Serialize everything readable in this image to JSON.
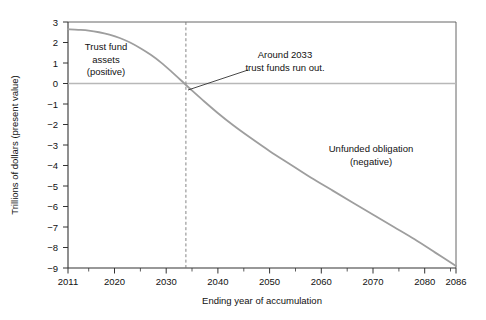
{
  "chart_data": {
    "type": "line",
    "title": "",
    "xlabel": "Ending year of accumulation",
    "ylabel": "Trillions of dollars (present value)",
    "xlim": [
      2011,
      2086
    ],
    "ylim": [
      -9,
      3
    ],
    "grid": false,
    "legend_position": "none",
    "x_ticks": [
      2011,
      2020,
      2030,
      2040,
      2050,
      2060,
      2070,
      2080,
      2086
    ],
    "x_tick_labels": [
      "2011",
      "2020",
      "2030",
      "2040",
      "2050",
      "2060",
      "2070",
      "2080",
      "2086"
    ],
    "x_minor_ticks": [
      2015,
      2025,
      2035,
      2045,
      2055,
      2065,
      2075,
      2085
    ],
    "y_ticks": [
      3,
      2,
      1,
      0,
      -1,
      -2,
      -3,
      -4,
      -5,
      -6,
      -7,
      -8,
      -9
    ],
    "y_tick_labels": [
      "3",
      "2",
      "1",
      "0",
      "−1",
      "−2",
      "−3",
      "−4",
      "−5",
      "−6",
      "−7",
      "−8",
      "−9"
    ],
    "zero_line_value": 0,
    "vline_x": 2033.5,
    "series": [
      {
        "name": "Trust fund balance (present value)",
        "color": "#9e9e9e",
        "x": [
          2011,
          2013,
          2015,
          2017,
          2019,
          2021,
          2023,
          2025,
          2027,
          2029,
          2031,
          2033.5,
          2035,
          2037,
          2040,
          2043,
          2046,
          2050,
          2054,
          2058,
          2062,
          2066,
          2070,
          2074,
          2078,
          2082,
          2086
        ],
        "values": [
          2.65,
          2.62,
          2.58,
          2.5,
          2.38,
          2.22,
          2.0,
          1.72,
          1.4,
          1.02,
          0.58,
          0.0,
          -0.35,
          -0.8,
          -1.45,
          -2.05,
          -2.6,
          -3.3,
          -3.95,
          -4.6,
          -5.2,
          -5.8,
          -6.4,
          -7.0,
          -7.6,
          -8.25,
          -8.9
        ]
      }
    ],
    "annotations": [
      {
        "id": "positive-region-label",
        "lines": [
          "Trust fund",
          "assets",
          "(positive)"
        ],
        "x_px": 106,
        "y_px": 50
      },
      {
        "id": "trust-funds-run-out-label",
        "lines": [
          "Around 2033",
          "trust funds run out."
        ],
        "x_px": 280,
        "y_px": 58
      },
      {
        "id": "negative-region-label",
        "lines": [
          "Unfunded obligation",
          "(negative)"
        ],
        "x_px": 365,
        "y_px": 152
      }
    ],
    "leader_line": {
      "from_px": [
        248,
        70
      ],
      "to_px": [
        188,
        90
      ]
    }
  }
}
